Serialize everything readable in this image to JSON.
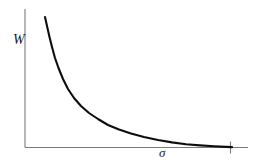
{
  "figure": {
    "background_color": "#ffffff",
    "width": 266,
    "height": 165
  },
  "chart_data": {
    "type": "line",
    "title": "",
    "subtitle": "",
    "xlabel": "σ",
    "ylabel": "W",
    "xlabel_name": "sigma",
    "ylabel_name": "W",
    "grid": false,
    "legend": null,
    "legend_position": "none",
    "axis_color": "#7a7a7a",
    "curve_color": "#0d0d0d",
    "curve_width_px": 2.1,
    "axis_width_px": 1.1,
    "xlim": [
      0,
      1
    ],
    "ylim": [
      0,
      1
    ],
    "x_tick_labels": [],
    "y_tick_labels": [],
    "x_ticks_drawn": [
      0.92
    ],
    "annotations": [],
    "series": [
      {
        "name": "W(sigma)",
        "color": "#0d0d0d",
        "x": [
          0.09,
          0.105,
          0.12,
          0.14,
          0.165,
          0.195,
          0.24,
          0.3,
          0.38,
          0.47,
          0.57,
          0.66,
          0.76,
          0.86,
          0.93
        ],
        "y": [
          0.94,
          0.84,
          0.75,
          0.655,
          0.56,
          0.47,
          0.37,
          0.285,
          0.21,
          0.155,
          0.11,
          0.08,
          0.052,
          0.028,
          0.012
        ]
      }
    ]
  },
  "geometry": {
    "y_axis": {
      "x": 25,
      "y_top": 9,
      "y_bottom": 147.5
    },
    "x_axis": {
      "y": 147.5,
      "x_left": 25,
      "x_right": 248
    },
    "x_tick": {
      "x": 230.5,
      "y_top": 141.5,
      "y_bottom": 153.5
    },
    "curve_points": "45,17 47,26 49.5,37 52,47 55,58 58.5,68 63,79 68,89 74,98 81,106 89,113 98,119 108,125 119,129.5 131,133.5 144,137 158,140 172,142.4 186,144.2 200,145.4 214,146.3 226,146.9 232,147.1"
  }
}
